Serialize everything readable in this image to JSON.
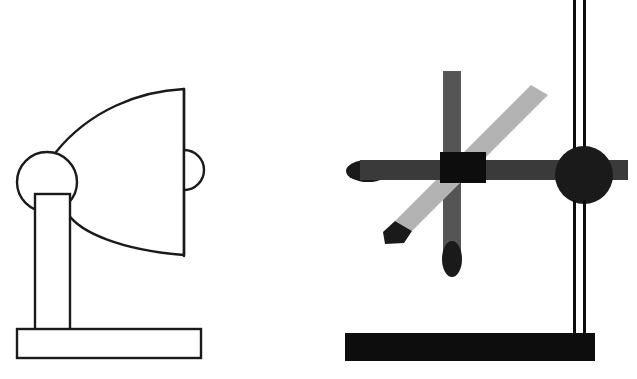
{
  "canvas": {
    "width": 637,
    "height": 379,
    "background": "#ffffff",
    "title": "Two line-drawn mechanical apparatus figures"
  },
  "palette": {
    "outline": "#1a1a1a",
    "white_fill": "#ffffff",
    "black": "#0d0d0d",
    "dark_gray": "#3a3a3a",
    "mid_gray": "#555555",
    "light_gray": "#b3b3b3"
  },
  "figures": [
    {
      "id": "left-figure",
      "name": "satellite-dish-on-stand",
      "style": "line-art-outline",
      "parts": [
        {
          "name": "dish-reflector",
          "shape": "parabolic-dish",
          "fill": "#ffffff",
          "stroke": "#1a1a1a",
          "stroke_width": 2,
          "path": "M 184 89 L 184 255 C 120 250 80 232 68 214 C 55 192 53 172 56 152 C 90 110 140 91 184 89 Z"
        },
        {
          "name": "feed-horn-bulge",
          "shape": "half-circle",
          "fill": "#ffffff",
          "stroke": "#1a1a1a",
          "stroke_width": 2,
          "path": "M 184 150 A 20 20 0 0 1 184 190"
        },
        {
          "name": "dish-right-edge",
          "shape": "vertical-line",
          "stroke": "#1a1a1a",
          "stroke_width": 2,
          "x1": 184,
          "y1": 89,
          "x2": 184,
          "y2": 256
        },
        {
          "name": "pivot-joint-circle",
          "shape": "circle",
          "fill": "#ffffff",
          "stroke": "#1a1a1a",
          "stroke_width": 2,
          "cx": 47,
          "cy": 182,
          "r": 30
        },
        {
          "name": "support-post",
          "shape": "rectangle",
          "fill": "#ffffff",
          "stroke": "#1a1a1a",
          "stroke_width": 2,
          "x": 35,
          "y": 194,
          "width": 35,
          "height": 136
        },
        {
          "name": "base-plate",
          "shape": "rectangle",
          "fill": "#ffffff",
          "stroke": "#1a1a1a",
          "stroke_width": 2,
          "x": 17,
          "y": 329,
          "width": 184,
          "height": 29
        }
      ]
    },
    {
      "id": "right-figure",
      "name": "crossed-bars-on-stand",
      "style": "solid-silhouette",
      "parts": [
        {
          "name": "base-plate-black",
          "shape": "rectangle",
          "fill": "#0d0d0d",
          "x": 345,
          "y": 333,
          "width": 250,
          "height": 28
        },
        {
          "name": "vertical-pole-left-rail",
          "shape": "rectangle",
          "fill": "#0d0d0d",
          "x": 573,
          "y": 0,
          "width": 3,
          "height": 335
        },
        {
          "name": "vertical-pole-right-rail",
          "shape": "rectangle",
          "fill": "#0d0d0d",
          "x": 583,
          "y": 0,
          "width": 3,
          "height": 335
        },
        {
          "name": "vertical-gray-bar",
          "shape": "rectangle",
          "fill": "#555555",
          "x": 443,
          "y": 71,
          "width": 18,
          "height": 186
        },
        {
          "name": "vertical-bar-tip-ellipse",
          "shape": "ellipse",
          "fill": "#1a1a1a",
          "cx": 452,
          "cy": 259,
          "rx": 10,
          "ry": 18
        },
        {
          "name": "diagonal-light-bar",
          "shape": "angled-bar",
          "fill": "#b3b3b3",
          "path": "M 531 85 L 548 95 L 412 231 L 395 221 Z"
        },
        {
          "name": "diagonal-bar-lower-tip",
          "shape": "angled-cap",
          "fill": "#1a1a1a",
          "path": "M 412 231 L 395 221 L 383 232 L 385 244 L 404 243 Z"
        },
        {
          "name": "horizontal-dark-bar",
          "shape": "rectangle",
          "fill": "#3a3a3a",
          "x": 360,
          "y": 160,
          "width": 268,
          "height": 20
        },
        {
          "name": "horizontal-bar-left-ellipse",
          "shape": "ellipse",
          "fill": "#1a1a1a",
          "cx": 368,
          "cy": 171,
          "rx": 22,
          "ry": 11
        },
        {
          "name": "center-clamp-block",
          "shape": "rectangle",
          "fill": "#0d0d0d",
          "x": 440,
          "y": 152,
          "width": 46,
          "height": 31
        },
        {
          "name": "pivot-hub-circle",
          "shape": "circle",
          "fill": "#1a1a1a",
          "cx": 584,
          "cy": 175,
          "r": 29
        }
      ]
    }
  ]
}
